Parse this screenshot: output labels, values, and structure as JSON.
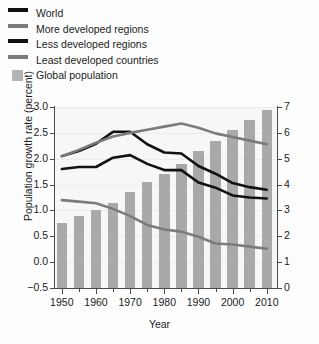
{
  "legend": {
    "items": [
      {
        "label": "World",
        "style": "line",
        "color": "#111111",
        "name": "legend-item-world"
      },
      {
        "label": "More developed regions",
        "style": "line",
        "color": "#7b7b7b",
        "name": "legend-item-more-developed-regions"
      },
      {
        "label": "Less developed regions",
        "style": "line",
        "color": "#111111",
        "name": "legend-item-less-developed-regions"
      },
      {
        "label": "Least developed countries",
        "style": "line",
        "color": "#7b7b7b",
        "name": "legend-item-least-developed-countries"
      },
      {
        "label": "Global population",
        "style": "box",
        "color": "#b4b4b4",
        "name": "legend-item-global-population"
      }
    ]
  },
  "chart_data": {
    "type": "line",
    "title": "",
    "xlabel": "Year",
    "ylabel": "Population growth rate (percent)",
    "y2label": "Global population (billions of people)",
    "xlim": [
      1948,
      2013
    ],
    "ylim": [
      -0.5,
      3.0
    ],
    "y2lim": [
      0,
      7
    ],
    "grid": true,
    "legend_position": "above-plot",
    "xticks": [
      1950,
      1960,
      1970,
      1980,
      1990,
      2000,
      2010
    ],
    "xticks_minor": [
      1955,
      1965,
      1975,
      1985,
      1995,
      2005
    ],
    "yticks": [
      "-0.5",
      "0.0",
      "0.5",
      "1.0",
      "1.5",
      "2.0",
      "2.5",
      "3.0"
    ],
    "y2ticks": [
      "0",
      "1",
      "2",
      "3",
      "4",
      "5",
      "6",
      "7"
    ],
    "x": [
      1950,
      1955,
      1960,
      1965,
      1970,
      1975,
      1980,
      1985,
      1990,
      1995,
      2000,
      2005,
      2010
    ],
    "series": [
      {
        "name": "World",
        "color": "#111111",
        "axis": "left",
        "values": [
          1.8,
          1.84,
          1.84,
          2.02,
          2.07,
          1.9,
          1.78,
          1.78,
          1.54,
          1.44,
          1.29,
          1.25,
          1.23
        ]
      },
      {
        "name": "More developed regions",
        "color": "#7b7b7b",
        "axis": "left",
        "values": [
          1.2,
          1.17,
          1.14,
          1.03,
          0.89,
          0.72,
          0.63,
          0.59,
          0.49,
          0.36,
          0.34,
          0.3,
          0.26
        ]
      },
      {
        "name": "Less developed regions",
        "color": "#111111",
        "axis": "left",
        "values": [
          2.05,
          2.15,
          2.29,
          2.52,
          2.52,
          2.28,
          2.12,
          2.1,
          1.86,
          1.71,
          1.53,
          1.45,
          1.4
        ]
      },
      {
        "name": "Least developed countries",
        "color": "#7b7b7b",
        "axis": "left",
        "values": [
          2.05,
          2.17,
          2.31,
          2.43,
          2.5,
          2.56,
          2.62,
          2.68,
          2.6,
          2.49,
          2.42,
          2.35,
          2.28
        ]
      }
    ],
    "bars": {
      "name": "Global population",
      "color": "#a9a9a9",
      "axis": "right",
      "unit": "billions",
      "values": [
        2.5,
        2.8,
        3.0,
        3.3,
        3.7,
        4.1,
        4.4,
        4.8,
        5.3,
        5.7,
        6.1,
        6.5,
        6.9
      ]
    }
  }
}
